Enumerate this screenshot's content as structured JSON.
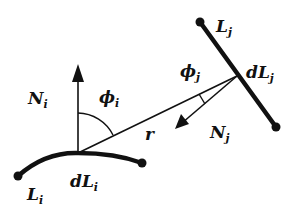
{
  "diagram": {
    "type": "geometry-radiosity-line-elements",
    "labels": {
      "Ni": {
        "main": "N",
        "sub": "i"
      },
      "phi_i": {
        "main": "ϕ",
        "sub": "i"
      },
      "Lj": {
        "main": "L",
        "sub": "j"
      },
      "phi_j": {
        "main": "ϕ",
        "sub": "j"
      },
      "dLj": {
        "main": "dL",
        "sub": "j"
      },
      "r": {
        "main": "r"
      },
      "Nj": {
        "main": "N",
        "sub": "j"
      },
      "Li": {
        "main": "L",
        "sub": "i"
      },
      "dLi": {
        "main": "dL",
        "sub": "i"
      }
    },
    "colors": {
      "stroke": "#111111",
      "background": "#ffffff"
    }
  }
}
